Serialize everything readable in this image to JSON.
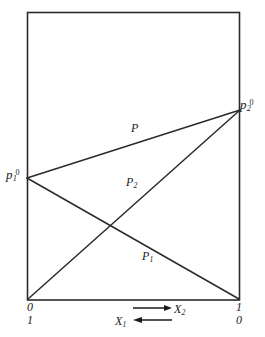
{
  "figure": {
    "type": "line-diagram",
    "box": {
      "left": 27,
      "top": 12,
      "right": 240,
      "bottom": 300
    },
    "points": {
      "p1_zero": {
        "x": 27,
        "y": 178,
        "label_main": "p",
        "label_sub": "1",
        "label_sup": "0"
      },
      "p2_zero": {
        "x": 240,
        "y": 110,
        "label_main": "p",
        "label_sub": "2",
        "label_sup": "0"
      },
      "origin_left": {
        "x": 27,
        "y": 300
      },
      "origin_right": {
        "x": 240,
        "y": 300
      }
    },
    "lines": [
      {
        "name": "P",
        "from": "p1_zero",
        "to": "p2_zero",
        "label_main": "P",
        "label_sub": ""
      },
      {
        "name": "P2",
        "from": "origin_left",
        "to": "p2_zero",
        "label_main": "P",
        "label_sub": "2"
      },
      {
        "name": "P1",
        "from": "p1_zero",
        "to": "origin_right",
        "label_main": "P",
        "label_sub": "1"
      }
    ],
    "axis": {
      "bottom_left_values": [
        "0",
        "1"
      ],
      "bottom_right_values": [
        "1",
        "0"
      ],
      "arrows": [
        {
          "name": "x2-arrow",
          "direction": "right",
          "label_main": "X",
          "label_sub": "2"
        },
        {
          "name": "x1-arrow",
          "direction": "left",
          "label_main": "X",
          "label_sub": "1"
        }
      ]
    },
    "colors": {
      "ink": "#1a1a1a",
      "line": "#2b2b2b",
      "background": "#ffffff"
    }
  }
}
